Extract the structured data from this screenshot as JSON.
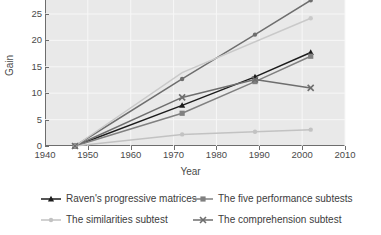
{
  "chart_data": {
    "type": "line",
    "title": "",
    "xlabel": "Year",
    "ylabel": "Gain",
    "xlim": [
      1940,
      2010
    ],
    "ylim": [
      0,
      27.5
    ],
    "grid": true,
    "legend_position": "bottom",
    "xticks": [
      1940,
      1950,
      1960,
      1970,
      1980,
      1990,
      2000,
      2010
    ],
    "yticks": [
      0,
      5,
      10,
      15,
      20,
      25
    ],
    "x": [
      1947,
      1972,
      1989,
      2002
    ],
    "series": [
      {
        "name": "Raven's progressive matrices",
        "values": [
          0,
          7.7,
          13.1,
          17.7
        ],
        "color": "#1c1c1c",
        "marker": "triangle"
      },
      {
        "name": "The five performance subtests",
        "values": [
          0,
          6.2,
          12.2,
          17.0
        ],
        "color": "#808080",
        "marker": "square"
      },
      {
        "name": "The similarities subtest",
        "values": [
          0,
          2.2,
          2.7,
          3.1
        ],
        "color": "#c2c2c2",
        "marker": "circle"
      },
      {
        "name": "The comprehension subtest",
        "values": [
          0,
          9.2,
          12.6,
          11.0
        ],
        "color": "#6e6e6e",
        "marker": "x"
      }
    ]
  },
  "axes": {
    "x_title": "Year",
    "y_title": "Gain",
    "x_tick_labels": [
      "1940",
      "1950",
      "1960",
      "1970",
      "1980",
      "1990",
      "2000",
      "2010"
    ],
    "y_tick_labels": [
      "0",
      "5",
      "10",
      "15",
      "20",
      "25"
    ]
  },
  "legend": {
    "items": [
      {
        "label": "Raven's progressive matrices",
        "color": "#1c1c1c",
        "marker": "triangle"
      },
      {
        "label": "The five performance subtests",
        "color": "#808080",
        "marker": "square"
      },
      {
        "label": "The similarities subtest",
        "color": "#c2c2c2",
        "marker": "circle"
      },
      {
        "label": "The comprehension subtest",
        "color": "#6e6e6e",
        "marker": "x"
      }
    ]
  },
  "colors": {
    "plot_background": "#e9e9e9",
    "gridline": "#f7f7f7",
    "axis": "#6d6d6d",
    "tick_text": "#4a4a4a",
    "legend_text": "#3c3c3c"
  }
}
